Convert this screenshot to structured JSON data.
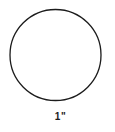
{
  "diagram": {
    "label": "1\"",
    "circle": {
      "stroke_color": "#1c1c1c",
      "fill": "none",
      "diameter_label": "1\""
    },
    "background_color": "#ffffff"
  }
}
